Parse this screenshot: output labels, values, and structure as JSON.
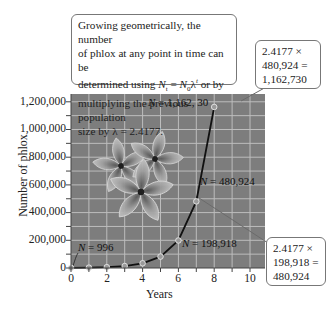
{
  "chart_data": {
    "type": "line",
    "title": "",
    "xlabel": "Years",
    "ylabel": "Number of phlox",
    "x": [
      0,
      1,
      2,
      3,
      4,
      5,
      6,
      7,
      8
    ],
    "series": [
      {
        "name": "Phlox population",
        "values": [
          996,
          2408,
          5822,
          14076,
          34032,
          82279,
          198918,
          480924,
          1162730
        ]
      }
    ],
    "xlim": [
      0,
      10.8
    ],
    "ylim": [
      0,
      1250000
    ],
    "xticks": [
      "0",
      "2",
      "4",
      "6",
      "8",
      "10"
    ],
    "yticks": [
      "0",
      "200,000",
      "400,000",
      "600,000",
      "800,000",
      "1,000,000",
      "1,200,000"
    ],
    "grid": true,
    "legend": "none",
    "point_labels": [
      {
        "x": 0,
        "text_prefix": "N",
        "text_value": " = 996"
      },
      {
        "x": 6,
        "text_prefix": "N",
        "text_value": " = 198,918"
      },
      {
        "x": 7,
        "text_prefix": "N",
        "text_value": " = 480,924"
      },
      {
        "x": 8,
        "text_prefix": "N",
        "text_value": " = 1,162, 30"
      }
    ],
    "annotations": {
      "main": {
        "line1": "Growing geometrically, the number",
        "line2": "of phlox at any point in time can be",
        "line3_a": "determined using ",
        "line3_formula": "N_t = N_0 λ^t",
        "line3_b": " or by",
        "line4": "multiplying the previous population",
        "line5": "size by λ = 2.4177."
      },
      "top_right": {
        "line1": "2.4177 ×",
        "line2": "480,924 =",
        "line3": "1,162,730"
      },
      "bottom_right": {
        "line1": "2.4177 ×",
        "line2": "198,918 =",
        "line3": "480,924"
      }
    },
    "background_image": "phlox-flowers",
    "colors": {
      "plot_bg": "#7d7d7d",
      "grid": "#c9c9c9",
      "line": "#111111",
      "marker_fill": "#9a9a9a"
    }
  }
}
